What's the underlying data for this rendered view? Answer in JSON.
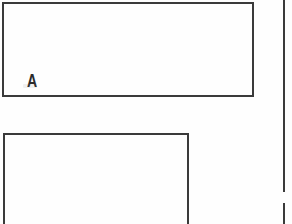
{
  "figure": {
    "background_color": "#fefefe",
    "stroke_color": "#3a3a3a",
    "label_color": "#2b2b2b",
    "panels": [
      {
        "id": "panel-a",
        "label": "A",
        "label_position": "bottom-left",
        "frame": {
          "x": 2,
          "y": 2,
          "width": 252,
          "height": 95
        },
        "border_width": 2,
        "content": "",
        "cropped_edges": []
      },
      {
        "id": "panel-b",
        "label": "B",
        "label_position": "bottom-left",
        "frame": {
          "x": 3,
          "y": 133,
          "width": 186,
          "height": 110
        },
        "border_width": 2,
        "content": "",
        "cropped_edges": [
          "bottom"
        ]
      },
      {
        "id": "panel-c",
        "label": "",
        "label_position": "",
        "frame": {
          "x": 283,
          "y": 0,
          "width": 9,
          "height": 224
        },
        "border_width": 2,
        "content": "",
        "cropped_edges": [
          "top",
          "right",
          "bottom"
        ],
        "rule_segments": [
          {
            "y": 0,
            "height": 192
          },
          {
            "y": 203,
            "height": 21
          }
        ]
      }
    ]
  }
}
